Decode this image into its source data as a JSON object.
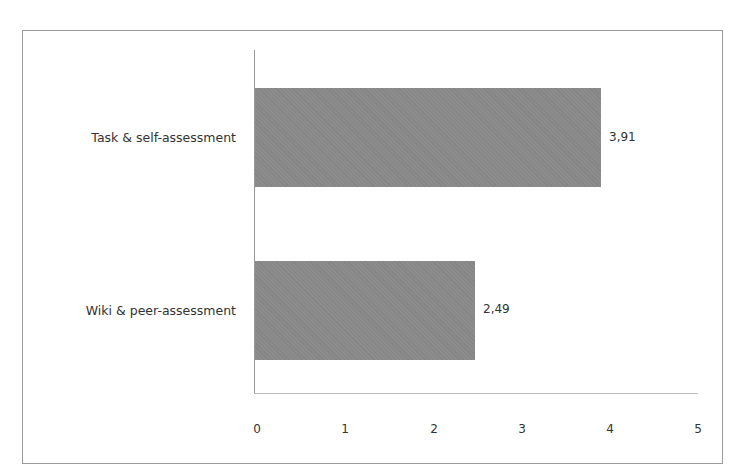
{
  "chart_data": {
    "type": "bar",
    "orientation": "horizontal",
    "title": "",
    "xlabel": "",
    "ylabel": "",
    "categories": [
      "Task & self-assessment",
      "Wiki & peer-assessment"
    ],
    "values": [
      3.91,
      2.49
    ],
    "value_labels": [
      "3,91",
      "2,49"
    ],
    "xlim": [
      0,
      5
    ],
    "x_ticks": [
      "0",
      "1",
      "2",
      "3",
      "4",
      "5"
    ],
    "grid": false,
    "legend": null,
    "bar_color": "#8c8c8c"
  }
}
